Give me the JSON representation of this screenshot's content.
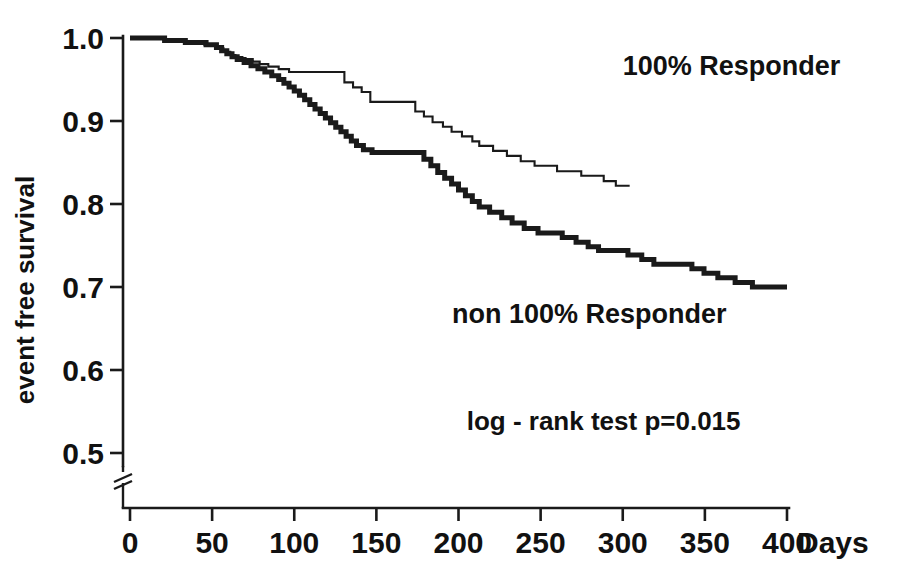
{
  "chart_data": {
    "type": "line",
    "subtype": "kaplan-meier-step",
    "title": "",
    "xlabel": "Days",
    "ylabel": "event free survival",
    "xlim": [
      0,
      400
    ],
    "ylim": [
      0.5,
      1.0
    ],
    "y_axis_break": true,
    "grid": false,
    "legend_position": "inline-annotations",
    "x_ticks": [
      "0",
      "50",
      "100",
      "150",
      "200",
      "250",
      "300",
      "350",
      "400"
    ],
    "x_tick_values": [
      0,
      50,
      100,
      150,
      200,
      250,
      300,
      350,
      400
    ],
    "y_ticks": [
      "1.0",
      "0.9",
      "0.8",
      "0.7",
      "0.6",
      "0.5"
    ],
    "y_tick_values": [
      1.0,
      0.9,
      0.8,
      0.7,
      0.6,
      0.5
    ],
    "annotations": [
      {
        "name": "log-rank-test",
        "text": "log - rank test  p=0.015",
        "x": 205,
        "y": 0.528
      }
    ],
    "series": [
      {
        "name": "100% Responder",
        "label": "100% Responder",
        "style": "thin",
        "stroke": "#1a1a1a",
        "stroke_width": 2.1,
        "label_x": 300,
        "label_y": 0.955,
        "points": [
          [
            0,
            1.0
          ],
          [
            40,
            1.0
          ],
          [
            40,
            0.998
          ],
          [
            62,
            0.998
          ],
          [
            62,
            0.996
          ],
          [
            86,
            0.996
          ],
          [
            86,
            0.992
          ],
          [
            100,
            0.992
          ],
          [
            100,
            0.988
          ],
          [
            108,
            0.988
          ],
          [
            108,
            0.9835
          ],
          [
            116,
            0.9835
          ],
          [
            116,
            0.9795
          ],
          [
            122,
            0.9795
          ],
          [
            122,
            0.977
          ],
          [
            130,
            0.977
          ],
          [
            130,
            0.9745
          ],
          [
            142,
            0.9745
          ],
          [
            142,
            0.9715
          ],
          [
            150,
            0.9715
          ],
          [
            150,
            0.9685
          ],
          [
            160,
            0.9685
          ],
          [
            160,
            0.9655
          ],
          [
            172,
            0.9655
          ],
          [
            172,
            0.9625
          ],
          [
            184,
            0.9625
          ],
          [
            184,
            0.959
          ],
          [
            248,
            0.959
          ],
          [
            248,
            0.9465
          ],
          [
            258,
            0.9465
          ],
          [
            258,
            0.9405
          ],
          [
            268,
            0.9405
          ],
          [
            268,
            0.935
          ],
          [
            278,
            0.935
          ],
          [
            278,
            0.923
          ],
          [
            330,
            0.923
          ],
          [
            330,
            0.9115
          ],
          [
            340,
            0.9115
          ],
          [
            340,
            0.9055
          ],
          [
            350,
            0.9055
          ],
          [
            350,
            0.8985
          ],
          [
            362,
            0.8985
          ],
          [
            362,
            0.893
          ],
          [
            372,
            0.893
          ],
          [
            372,
            0.887
          ],
          [
            384,
            0.887
          ],
          [
            384,
            0.8815
          ],
          [
            396,
            0.8815
          ],
          [
            396,
            0.8755
          ],
          [
            404,
            0.8755
          ],
          [
            404,
            0.87
          ],
          [
            420,
            0.87
          ],
          [
            420,
            0.864
          ],
          [
            436,
            0.864
          ],
          [
            436,
            0.858
          ],
          [
            452,
            0.858
          ],
          [
            452,
            0.8515
          ],
          [
            468,
            0.8515
          ],
          [
            468,
            0.846
          ],
          [
            494,
            0.846
          ],
          [
            494,
            0.8395
          ],
          [
            522,
            0.8395
          ],
          [
            522,
            0.834
          ],
          [
            548,
            0.834
          ],
          [
            548,
            0.8275
          ],
          [
            562,
            0.8275
          ],
          [
            562,
            0.822
          ],
          [
            578,
            0.822
          ]
        ],
        "note": "x values in this list are pixel-day-like indices along 0..400 scaled internally"
      },
      {
        "name": "non 100% Responder",
        "label": "non 100% Responder",
        "style": "thick",
        "stroke": "#1a1a1a",
        "stroke_width": 5.0,
        "label_x": 196,
        "label_y": 0.657,
        "points": [
          [
            0,
            1.0
          ],
          [
            40,
            1.0
          ],
          [
            40,
            0.997
          ],
          [
            64,
            0.997
          ],
          [
            64,
            0.9945
          ],
          [
            88,
            0.9945
          ],
          [
            88,
            0.992
          ],
          [
            100,
            0.992
          ],
          [
            100,
            0.9885
          ],
          [
            106,
            0.9885
          ],
          [
            106,
            0.9845
          ],
          [
            112,
            0.9845
          ],
          [
            112,
            0.981
          ],
          [
            118,
            0.981
          ],
          [
            118,
            0.9775
          ],
          [
            124,
            0.9775
          ],
          [
            124,
            0.974
          ],
          [
            132,
            0.974
          ],
          [
            132,
            0.9705
          ],
          [
            140,
            0.9705
          ],
          [
            140,
            0.9665
          ],
          [
            148,
            0.9665
          ],
          [
            148,
            0.963
          ],
          [
            156,
            0.963
          ],
          [
            156,
            0.959
          ],
          [
            164,
            0.959
          ],
          [
            164,
            0.9545
          ],
          [
            172,
            0.9545
          ],
          [
            172,
            0.95
          ],
          [
            178,
            0.95
          ],
          [
            178,
            0.9455
          ],
          [
            184,
            0.9455
          ],
          [
            184,
            0.941
          ],
          [
            190,
            0.941
          ],
          [
            190,
            0.936
          ],
          [
            196,
            0.936
          ],
          [
            196,
            0.931
          ],
          [
            202,
            0.931
          ],
          [
            202,
            0.9255
          ],
          [
            208,
            0.9255
          ],
          [
            208,
            0.92
          ],
          [
            214,
            0.92
          ],
          [
            214,
            0.9145
          ],
          [
            220,
            0.9145
          ],
          [
            220,
            0.909
          ],
          [
            226,
            0.909
          ],
          [
            226,
            0.9035
          ],
          [
            232,
            0.9035
          ],
          [
            232,
            0.898
          ],
          [
            238,
            0.898
          ],
          [
            238,
            0.8925
          ],
          [
            244,
            0.8925
          ],
          [
            244,
            0.887
          ],
          [
            250,
            0.887
          ],
          [
            250,
            0.8815
          ],
          [
            256,
            0.8815
          ],
          [
            256,
            0.876
          ],
          [
            262,
            0.876
          ],
          [
            262,
            0.8705
          ],
          [
            270,
            0.8705
          ],
          [
            270,
            0.8655
          ],
          [
            280,
            0.8655
          ],
          [
            280,
            0.862
          ],
          [
            340,
            0.862
          ],
          [
            340,
            0.854
          ],
          [
            348,
            0.854
          ],
          [
            348,
            0.846
          ],
          [
            356,
            0.846
          ],
          [
            356,
            0.838
          ],
          [
            364,
            0.838
          ],
          [
            364,
            0.831
          ],
          [
            372,
            0.831
          ],
          [
            372,
            0.824
          ],
          [
            380,
            0.824
          ],
          [
            380,
            0.817
          ],
          [
            388,
            0.817
          ],
          [
            388,
            0.81
          ],
          [
            396,
            0.81
          ],
          [
            396,
            0.803
          ],
          [
            404,
            0.803
          ],
          [
            404,
            0.7965
          ],
          [
            416,
            0.7965
          ],
          [
            416,
            0.79
          ],
          [
            430,
            0.79
          ],
          [
            430,
            0.7835
          ],
          [
            442,
            0.7835
          ],
          [
            442,
            0.777
          ],
          [
            456,
            0.777
          ],
          [
            456,
            0.7705
          ],
          [
            472,
            0.7705
          ],
          [
            472,
            0.765
          ],
          [
            500,
            0.765
          ],
          [
            500,
            0.7595
          ],
          [
            516,
            0.7595
          ],
          [
            516,
            0.754
          ],
          [
            530,
            0.754
          ],
          [
            530,
            0.7485
          ],
          [
            542,
            0.7485
          ],
          [
            542,
            0.744
          ],
          [
            576,
            0.744
          ],
          [
            576,
            0.7385
          ],
          [
            592,
            0.7385
          ],
          [
            592,
            0.733
          ],
          [
            606,
            0.733
          ],
          [
            606,
            0.7275
          ],
          [
            650,
            0.7275
          ],
          [
            650,
            0.722
          ],
          [
            664,
            0.722
          ],
          [
            664,
            0.7165
          ],
          [
            680,
            0.7165
          ],
          [
            680,
            0.711
          ],
          [
            700,
            0.711
          ],
          [
            700,
            0.7055
          ],
          [
            720,
            0.7055
          ],
          [
            720,
            0.7
          ],
          [
            760,
            0.7
          ]
        ]
      }
    ]
  },
  "figure": {
    "x_axis_unit": "Days",
    "y_axis_title": "event free survival"
  }
}
